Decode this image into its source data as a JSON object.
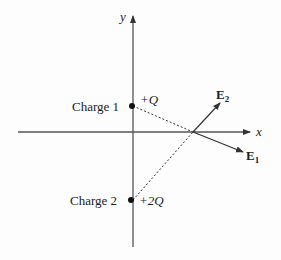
{
  "diagram": {
    "type": "electric-field-vector-diagram",
    "axes": {
      "x_label": "x",
      "y_label": "y"
    },
    "charges": [
      {
        "label": "Charge 1",
        "value": "+Q",
        "position": "on y-axis, above origin"
      },
      {
        "label": "Charge 2",
        "value": "+2Q",
        "position": "on y-axis, below origin"
      }
    ],
    "field_vectors": [
      {
        "label": "E",
        "subscript": "1",
        "description": "field from Charge 1, pointing down-right away from charge 1"
      },
      {
        "label": "E",
        "subscript": "2",
        "description": "field from Charge 2, pointing up-right away from charge 2"
      }
    ],
    "point": {
      "description": "point on positive x-axis where fields are evaluated"
    },
    "colors": {
      "line": "#333333",
      "text": "#222222",
      "background": "#fdfdfd"
    }
  }
}
